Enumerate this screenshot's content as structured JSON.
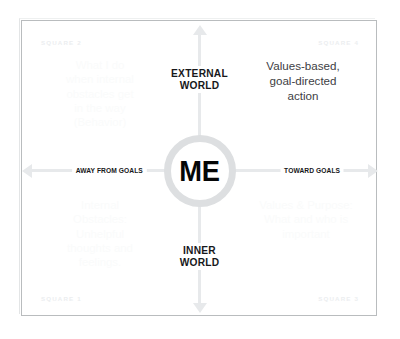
{
  "diagram": {
    "center": {
      "label": "ME",
      "icon": "circle-ring-icon"
    },
    "axes": {
      "vertical": {
        "top_caption": "EXTERNAL\nWORLD",
        "bottom_caption": "INNER\nWORLD",
        "arrow_up_icon": "arrow-up-icon",
        "arrow_down_icon": "arrow-down-icon"
      },
      "horizontal": {
        "left_caption": "AWAY FROM GOALS",
        "right_caption": "TOWARD GOALS",
        "arrow_left_icon": "arrow-left-icon",
        "arrow_right_icon": "arrow-right-icon"
      }
    },
    "corners": {
      "top_left": "SQUARE 2",
      "top_right": "SQUARE 4",
      "bottom_left": "SQUARE 1",
      "bottom_right": "SQUARE 3"
    },
    "quadrants": [
      {
        "id": "square-2",
        "position": "top-left",
        "text": "What I do\nwhen internal\nobstacles get\nin the way\n(Behavior)",
        "emphasis": "faint"
      },
      {
        "id": "square-4",
        "position": "top-right",
        "text": "Values-based,\ngoal-directed\naction",
        "emphasis": "dark"
      },
      {
        "id": "square-1",
        "position": "bottom-left",
        "text": "Internal\nObstacles:\nUnhelpful\nthoughts and\nfeelings.",
        "emphasis": "faint"
      },
      {
        "id": "square-3",
        "position": "bottom-right",
        "text": "Values & Purpose:\nWhat and who is\nimportant",
        "emphasis": "faint"
      }
    ],
    "colors": {
      "frame_border": "#b9bcbe",
      "axis_gray": "#e7e9eb",
      "ring_gray": "#dddfe1",
      "text_dark": "#17181a",
      "text_body_dark": "#3e4044",
      "text_faint": "#fafbfb",
      "corner_label": "#eceef0",
      "background": "#ffffff"
    }
  }
}
